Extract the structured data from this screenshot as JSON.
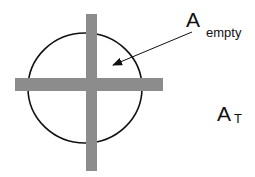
{
  "diagram": {
    "labels": {
      "empty_area": {
        "main": "A",
        "sub": "empty"
      },
      "total_area": {
        "main": "A",
        "sub": "T"
      }
    },
    "colors": {
      "bar": "#8c8c8c",
      "circle_stroke": "#111111",
      "arrow": "#111111",
      "background": "#ffffff"
    },
    "shapes": {
      "circle": {
        "cx": 85,
        "cy": 88,
        "rx": 57,
        "ry": 55
      },
      "vertical_bar": {
        "x": 86,
        "y": 14,
        "width": 11,
        "height": 157
      },
      "horizontal_bar": {
        "x": 15,
        "y": 78,
        "width": 148,
        "height": 13
      },
      "arrow": {
        "from": [
          192,
          32
        ],
        "to": [
          111,
          66
        ]
      }
    }
  }
}
